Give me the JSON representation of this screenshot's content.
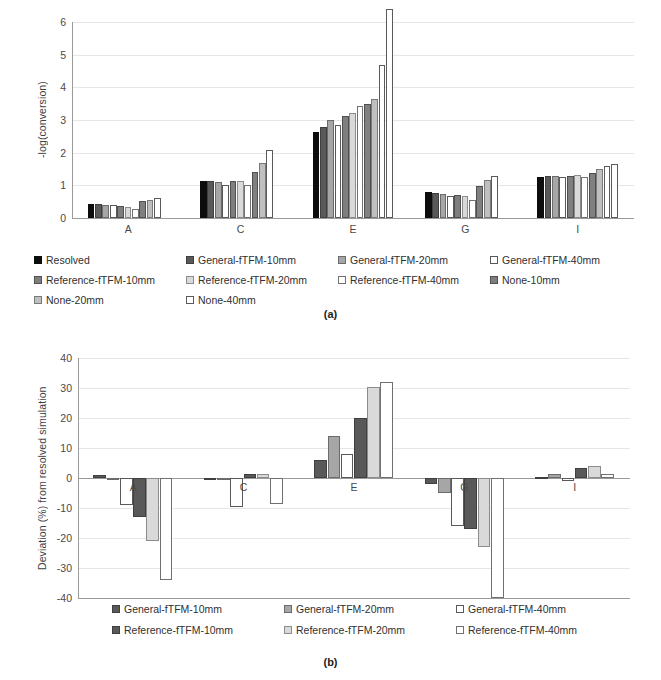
{
  "figure": {
    "caption_a": "(a)",
    "caption_b": "(b)"
  },
  "chart_data": [
    {
      "id": "a",
      "type": "bar",
      "title": "",
      "xlabel": "",
      "ylabel": "-log(conversion)",
      "categories": [
        "A",
        "C",
        "E",
        "G",
        "I"
      ],
      "ylim": [
        0,
        6
      ],
      "yticks": [
        0,
        1,
        2,
        3,
        4,
        5,
        6
      ],
      "ytick_labels": [
        "0",
        "1",
        "2",
        "3",
        "4",
        "5",
        "6"
      ],
      "grid": true,
      "legend_position": "below",
      "clipped_note": "last bar of group E exceeds axis maximum",
      "series": [
        {
          "name": "Resolved",
          "color": "#0d0d0d",
          "edge": "#0d0d0d",
          "values": [
            0.44,
            1.13,
            2.64,
            0.8,
            1.27
          ]
        },
        {
          "name": "General-fTFM-10mm",
          "color": "#595959",
          "edge": "#3f3f3f",
          "values": [
            0.43,
            1.12,
            2.8,
            0.78,
            1.28
          ]
        },
        {
          "name": "General-fTFM-20mm",
          "color": "#a6a6a6",
          "edge": "#6b6b6b",
          "values": [
            0.41,
            1.1,
            3.01,
            0.75,
            1.28
          ]
        },
        {
          "name": "General-fTFM-40mm",
          "color": "#ffffff",
          "edge": "#595959",
          "values": [
            0.4,
            1.02,
            2.86,
            0.68,
            1.26
          ]
        },
        {
          "name": "Reference-fTFM-10mm",
          "color": "#7f7f7f",
          "edge": "#4f4f4f",
          "values": [
            0.36,
            1.13,
            3.13,
            0.7,
            1.29
          ]
        },
        {
          "name": "Reference-fTFM-20mm",
          "color": "#d9d9d9",
          "edge": "#8c8c8c",
          "values": [
            0.34,
            1.14,
            3.2,
            0.66,
            1.31
          ]
        },
        {
          "name": "Reference-fTFM-40mm",
          "color": "#ffffff",
          "edge": "#707070",
          "values": [
            0.27,
            1.02,
            3.44,
            0.55,
            1.27
          ]
        },
        {
          "name": "None-10mm",
          "color": "#808080",
          "edge": "#4f4f4f",
          "values": [
            0.51,
            1.42,
            3.5,
            0.98,
            1.38
          ]
        },
        {
          "name": "None-20mm",
          "color": "#bfbfbf",
          "edge": "#7a7a7a",
          "values": [
            0.56,
            1.68,
            3.63,
            1.15,
            1.5
          ]
        },
        {
          "name": "None-40mm",
          "color": "#ffffff",
          "edge": "#5a5a5a",
          "values": [
            0.61,
            2.08,
            4.68,
            1.3,
            1.59
          ]
        },
        {
          "name": "None-40mm-clip",
          "color": "#ffffff",
          "edge": "#5a5a5a",
          "values": [
            0,
            0,
            6.4,
            0,
            1.66
          ],
          "hidden_in_legend": true
        }
      ]
    },
    {
      "id": "b",
      "type": "bar",
      "title": "",
      "xlabel": "",
      "ylabel": "Deviation (%) from resolved simulation",
      "categories": [
        "A",
        "C",
        "E",
        "G",
        "I"
      ],
      "ylim": [
        -40,
        40
      ],
      "yticks": [
        -40,
        -30,
        -20,
        -10,
        0,
        10,
        20,
        30,
        40
      ],
      "ytick_labels": [
        "-40",
        "-30",
        "-20",
        "-10",
        "0",
        "10",
        "20",
        "30",
        "40"
      ],
      "grid": true,
      "legend_position": "below",
      "series": [
        {
          "name": "General-fTFM-10mm",
          "color": "#595959",
          "edge": "#3f3f3f",
          "values": [
            1.0,
            -0.6,
            6.0,
            -2.0,
            0.5
          ]
        },
        {
          "name": "General-fTFM-20mm",
          "color": "#a6a6a6",
          "edge": "#6b6b6b",
          "values": [
            -0.8,
            -0.6,
            14.0,
            -5.0,
            1.5
          ]
        },
        {
          "name": "General-fTFM-40mm",
          "color": "#ffffff",
          "edge": "#595959",
          "values": [
            -9.0,
            -9.5,
            8.0,
            -16.0,
            -1.0
          ]
        },
        {
          "name": "Reference-fTFM-10mm",
          "color": "#595959",
          "edge": "#3f3f3f",
          "values": [
            -13.0,
            1.5,
            20.0,
            -17.0,
            3.5
          ]
        },
        {
          "name": "Reference-fTFM-20mm",
          "color": "#d9d9d9",
          "edge": "#8c8c8c",
          "values": [
            -21.0,
            1.3,
            30.5,
            -23.0,
            4.0
          ]
        },
        {
          "name": "Reference-fTFM-40mm",
          "color": "#ffffff",
          "edge": "#707070",
          "values": [
            -34.0,
            -8.5,
            32.0,
            -40.0,
            1.5
          ]
        }
      ]
    }
  ],
  "legend_a": {
    "items": [
      {
        "label": "Resolved",
        "color": "#0d0d0d",
        "edge": "#0d0d0d"
      },
      {
        "label": "General-fTFM-10mm",
        "color": "#595959",
        "edge": "#3f3f3f"
      },
      {
        "label": "General-fTFM-20mm",
        "color": "#a6a6a6",
        "edge": "#6b6b6b"
      },
      {
        "label": "General-fTFM-40mm",
        "color": "#ffffff",
        "edge": "#595959"
      },
      {
        "label": "Reference-fTFM-10mm",
        "color": "#7f7f7f",
        "edge": "#4f4f4f"
      },
      {
        "label": "Reference-fTFM-20mm",
        "color": "#d9d9d9",
        "edge": "#8c8c8c"
      },
      {
        "label": "Reference-fTFM-40mm",
        "color": "#ffffff",
        "edge": "#707070"
      },
      {
        "label": "None-10mm",
        "color": "#808080",
        "edge": "#4f4f4f"
      },
      {
        "label": "None-20mm",
        "color": "#bfbfbf",
        "edge": "#7a7a7a"
      },
      {
        "label": "None-40mm",
        "color": "#ffffff",
        "edge": "#5a5a5a"
      }
    ]
  },
  "legend_b": {
    "items": [
      {
        "label": "General-fTFM-10mm",
        "color": "#595959",
        "edge": "#3f3f3f"
      },
      {
        "label": "General-fTFM-20mm",
        "color": "#a6a6a6",
        "edge": "#6b6b6b"
      },
      {
        "label": "General-fTFM-40mm",
        "color": "#ffffff",
        "edge": "#595959"
      },
      {
        "label": "Reference-fTFM-10mm",
        "color": "#595959",
        "edge": "#3f3f3f"
      },
      {
        "label": "Reference-fTFM-20mm",
        "color": "#d9d9d9",
        "edge": "#8c8c8c"
      },
      {
        "label": "Reference-fTFM-40mm",
        "color": "#ffffff",
        "edge": "#707070"
      }
    ]
  }
}
